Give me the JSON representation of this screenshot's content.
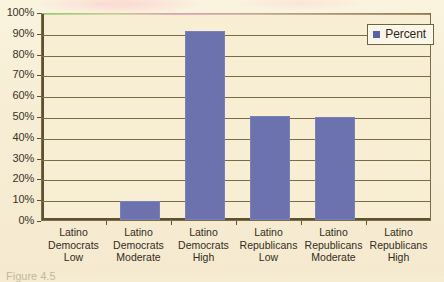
{
  "chart_data": {
    "type": "bar",
    "title": "",
    "xlabel": "",
    "ylabel": "",
    "ylim": [
      0,
      100
    ],
    "ytick_labels": [
      "100%",
      "90%",
      "80%",
      "70%",
      "60%",
      "50%",
      "40%",
      "30%",
      "20%",
      "10%",
      "0%"
    ],
    "ytick_values": [
      100,
      90,
      80,
      70,
      60,
      50,
      40,
      30,
      20,
      10,
      0
    ],
    "grid": true,
    "legend_position": "top-right",
    "legend": [
      "Percent"
    ],
    "categories": [
      "Latino Democrats Low",
      "Latino Democrats Moderate",
      "Latino Democrats High",
      "Latino Republicans Low",
      "Latino Republicans Moderate",
      "Latino Republicans High"
    ],
    "category_lines": [
      [
        "Latino",
        "Democrats",
        "Low"
      ],
      [
        "Latino",
        "Democrats",
        "Moderate"
      ],
      [
        "Latino",
        "Democrats",
        "High"
      ],
      [
        "Latino",
        "Republicans",
        "Low"
      ],
      [
        "Latino",
        "Republicans",
        "Moderate"
      ],
      [
        "Latino",
        "Republicans",
        "High"
      ]
    ],
    "series": [
      {
        "name": "Percent",
        "values": [
          0,
          9,
          91,
          50,
          49.5,
          0
        ]
      }
    ],
    "values": [
      0,
      9,
      91,
      50,
      49.5,
      0
    ],
    "bar_color": "#6b72ad"
  },
  "legend": {
    "label": "Percent"
  },
  "caption": {
    "text": "Figure 4.5"
  }
}
